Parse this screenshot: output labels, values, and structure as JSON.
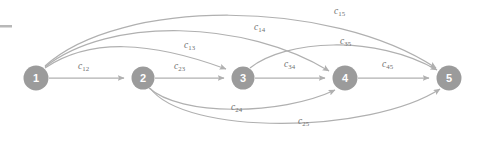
{
  "figure": {
    "type": "directed-graph",
    "title": "",
    "background_color": "#ffffff",
    "node_color": "#9b9b9b",
    "node_text_color": "#ffffff",
    "edge_color": "#b0b0b0",
    "label_color": "#6e6e6e"
  },
  "nodes": [
    {
      "id": "1",
      "label": "1",
      "cx": 36,
      "cy": 78,
      "r": 12.5
    },
    {
      "id": "2",
      "label": "2",
      "cx": 143,
      "cy": 78,
      "r": 11.5
    },
    {
      "id": "3",
      "label": "3",
      "cx": 243,
      "cy": 78,
      "r": 11.5
    },
    {
      "id": "4",
      "label": "4",
      "cx": 345,
      "cy": 78,
      "r": 12.5
    },
    {
      "id": "5",
      "label": "5",
      "cx": 449,
      "cy": 78,
      "r": 12.5
    }
  ],
  "edges": [
    {
      "id": "e12",
      "from": "1",
      "to": "2",
      "label": "c",
      "sub": "12",
      "label_x": 78,
      "label_y": 62
    },
    {
      "id": "e23",
      "from": "2",
      "to": "3",
      "label": "c",
      "sub": "23",
      "label_x": 174,
      "label_y": 62
    },
    {
      "id": "e34",
      "from": "3",
      "to": "4",
      "label": "c",
      "sub": "34",
      "label_x": 284,
      "label_y": 60
    },
    {
      "id": "e45",
      "from": "4",
      "to": "5",
      "label": "c",
      "sub": "45",
      "label_x": 382,
      "label_y": 60
    },
    {
      "id": "e13",
      "from": "1",
      "to": "3",
      "label": "c",
      "sub": "13",
      "label_x": 184,
      "label_y": 41
    },
    {
      "id": "e14",
      "from": "1",
      "to": "4",
      "label": "c",
      "sub": "14",
      "label_x": 254,
      "label_y": 23
    },
    {
      "id": "e15",
      "from": "1",
      "to": "5",
      "label": "c",
      "sub": "15",
      "label_x": 334,
      "label_y": 7
    },
    {
      "id": "e35",
      "from": "3",
      "to": "5",
      "label": "c",
      "sub": "35",
      "label_x": 340,
      "label_y": 37
    },
    {
      "id": "e24",
      "from": "2",
      "to": "4",
      "label": "c",
      "sub": "24",
      "label_x": 231,
      "label_y": 103
    },
    {
      "id": "e25",
      "from": "2",
      "to": "5",
      "label": "c",
      "sub": "25",
      "label_x": 298,
      "label_y": 117
    }
  ],
  "artifacts": {
    "crop_dash": {
      "x": 0,
      "y": 25,
      "width": 12,
      "height": 2.5
    }
  }
}
